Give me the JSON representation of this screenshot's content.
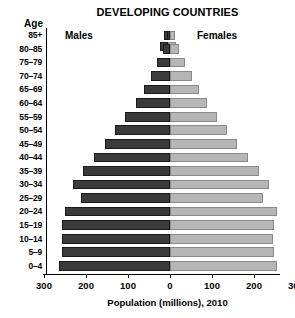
{
  "chart_data": {
    "type": "bar",
    "subtype": "population-pyramid",
    "title": "DEVELOPING COUNTRIES",
    "xlabel": "Population (millions), 2010",
    "ylabel": "Age",
    "xlim": [
      -300,
      300
    ],
    "xticks": [
      300,
      200,
      100,
      0,
      100,
      200,
      300
    ],
    "grid": false,
    "legend_position": "top",
    "categories": [
      "85+",
      "80–85",
      "75–79",
      "70–74",
      "65–69",
      "60–64",
      "55–59",
      "50–54",
      "45–49",
      "40–44",
      "35–39",
      "30–34",
      "25–29",
      "20–24",
      "15–19",
      "10–14",
      "5–9",
      "0–4"
    ],
    "series": [
      {
        "name": "Males",
        "color": "#3b3b3b",
        "side": "left",
        "values": [
          8,
          17,
          30,
          46,
          62,
          82,
          106,
          130,
          155,
          180,
          208,
          232,
          212,
          250,
          258,
          256,
          258,
          265
        ]
      },
      {
        "name": "Females",
        "color": "#b6b6b6",
        "side": "right",
        "values": [
          12,
          22,
          36,
          52,
          68,
          88,
          112,
          136,
          160,
          186,
          212,
          236,
          222,
          255,
          248,
          246,
          248,
          255
        ]
      }
    ],
    "legend": [
      "Males",
      "Females"
    ]
  },
  "legend_swatch": {
    "male_color": "#3b3b3b",
    "female_color": "#b6b6b6"
  }
}
